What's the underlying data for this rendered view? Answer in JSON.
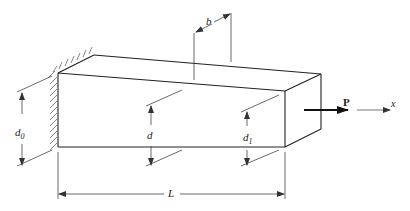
{
  "diagram": {
    "labels": {
      "b": "b",
      "d0_main": "d",
      "d0_sub": "0",
      "d": "d",
      "d1_main": "d",
      "d1_sub": "1",
      "L": "L",
      "P": "P",
      "x": "x"
    },
    "colors": {
      "line": "#222222",
      "dim": "#444444",
      "hatch": "#555555"
    }
  }
}
